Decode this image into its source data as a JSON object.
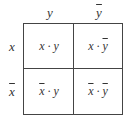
{
  "columns": [
    {
      "label": "y",
      "negated": false
    },
    {
      "label": "y",
      "negated": true
    }
  ],
  "rows": [
    {
      "label": "x",
      "negated": false
    },
    {
      "label": "x",
      "negated": true
    }
  ],
  "cells": [
    {
      "left": "x",
      "left_neg": false,
      "op": "·",
      "right": "y",
      "right_neg": false
    },
    {
      "left": "x",
      "left_neg": false,
      "op": "·",
      "right": "y",
      "right_neg": true
    },
    {
      "left": "x",
      "left_neg": true,
      "op": "·",
      "right": "y",
      "right_neg": false
    },
    {
      "left": "x",
      "left_neg": true,
      "op": "·",
      "right": "y",
      "right_neg": true
    }
  ]
}
